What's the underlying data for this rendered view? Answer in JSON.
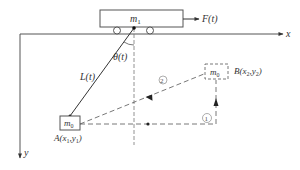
{
  "diagram": {
    "type": "physics-schematic",
    "cart": {
      "label": "m",
      "sub": "1"
    },
    "force": {
      "label": "F(t)"
    },
    "axes": {
      "x_label": "x",
      "y_label": "y"
    },
    "rope": {
      "label": "L(t)"
    },
    "angle": {
      "label": "θ(t)"
    },
    "payload_start": {
      "mass": "m",
      "mass_sub": "0",
      "point": "A(x",
      "s1": "1",
      "comma": ",y",
      "s2": "1",
      "close": ")"
    },
    "payload_end": {
      "mass": "m",
      "mass_sub": "0",
      "point": "B(x",
      "s1": "2",
      "comma": ",y",
      "s2": "2",
      "close": ")"
    },
    "paths": [
      {
        "id": "1",
        "label": "①",
        "description": "horizontal then vertical dashed path A→B"
      },
      {
        "id": "2",
        "label": "②",
        "description": "direct dashed diagonal path A→B"
      }
    ],
    "colors": {
      "stroke": "#333333",
      "dashed": "#555555"
    }
  }
}
